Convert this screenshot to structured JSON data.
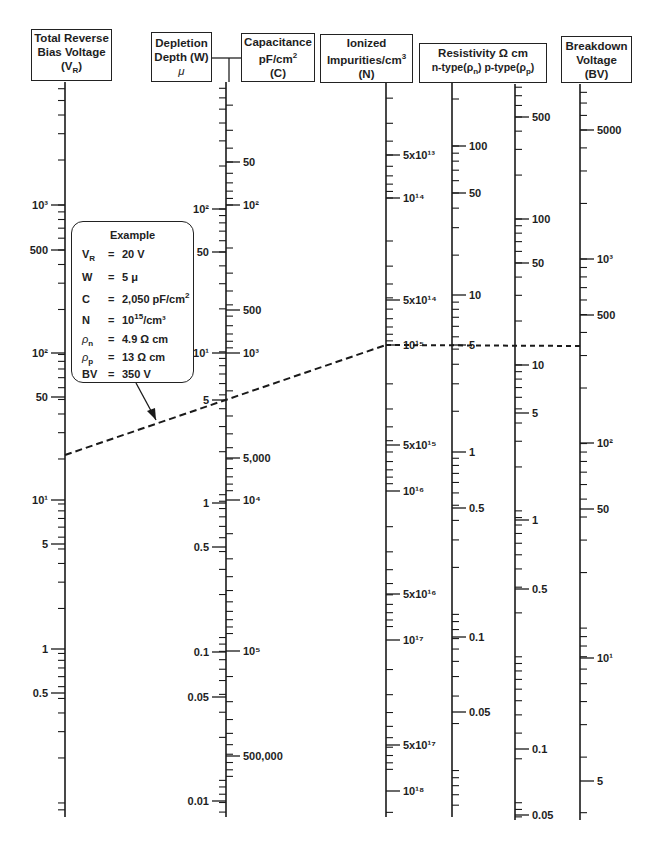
{
  "headers": {
    "vr": {
      "line1": "Total Reverse",
      "line2": "Bias Voltage",
      "line3": "(V",
      "line3_sub": "R",
      "line3_end": ")"
    },
    "w": {
      "line1": "Depletion",
      "line2": "Depth (W)",
      "line3": "μ"
    },
    "c": {
      "line1": "Capacitance",
      "line2": "pF/cm",
      "line2_sup": "2",
      "line3": "(C)"
    },
    "n": {
      "line1": "Ionized",
      "line2": "Impurities/cm",
      "line2_sup": "3",
      "line3": "(N)"
    },
    "rho": {
      "line1": "Resistivity Ω cm",
      "line2a": "n-type(ρ",
      "line2a_sub": "n",
      "line2b": ") p-type(ρ",
      "line2b_sub": "p",
      "line2c": ")"
    },
    "bv": {
      "line1": "Breakdown",
      "line2": "Voltage",
      "line3": "(BV)"
    }
  },
  "example": {
    "title": "Example",
    "rows": [
      {
        "sym": "V",
        "sym_sub": "R",
        "eq": "=",
        "val": "20 V",
        "sup": "",
        "tail": ""
      },
      {
        "sym": "W",
        "sym_sub": "",
        "eq": "=",
        "val": "5 μ",
        "sup": "",
        "tail": ""
      },
      {
        "sym": "C",
        "sym_sub": "",
        "eq": "=",
        "val": "2,050 pF/cm",
        "sup": "2",
        "tail": ""
      },
      {
        "sym": "N",
        "sym_sub": "",
        "eq": "=",
        "val": "10",
        "sup": "15",
        "tail": "/cm³"
      },
      {
        "sym": "ρ",
        "sym_sub": "n",
        "eq": "=",
        "val": "4.9 Ω cm",
        "sup": "",
        "tail": ""
      },
      {
        "sym": "ρ",
        "sym_sub": "p",
        "eq": "=",
        "val": "13 Ω cm",
        "sup": "",
        "tail": ""
      },
      {
        "sym": "BV",
        "sym_sub": "",
        "eq": "=",
        "val": "350 V",
        "sup": "",
        "tail": ""
      }
    ]
  },
  "chart_data": {
    "type": "nomograph",
    "axes": [
      {
        "id": "vr",
        "name": "Total Reverse Bias Voltage (V_R)",
        "x": 65,
        "y_top": 82,
        "y_bottom": 817,
        "label_side": "left",
        "labels": [
          {
            "text": "10³",
            "value": 1000,
            "y": 205
          },
          {
            "text": "500",
            "value": 500,
            "y": 250
          },
          {
            "text": "10²",
            "value": 100,
            "y": 353
          },
          {
            "text": "50",
            "value": 50,
            "y": 397
          },
          {
            "text": "10¹",
            "value": 10,
            "y": 500
          },
          {
            "text": "5",
            "value": 5,
            "y": 544
          },
          {
            "text": "1",
            "value": 1,
            "y": 649
          },
          {
            "text": "0.5",
            "value": 0.5,
            "y": 693
          }
        ]
      },
      {
        "id": "w",
        "name": "Depletion Depth (W) μ",
        "x": 226,
        "y_top": 82,
        "y_bottom": 817,
        "label_side": "left",
        "labels": [
          {
            "text": "10²",
            "value": 100,
            "y": 209
          },
          {
            "text": "50",
            "value": 50,
            "y": 252
          },
          {
            "text": "10¹",
            "value": 10,
            "y": 353
          },
          {
            "text": "5",
            "value": 5,
            "y": 400
          },
          {
            "text": "1",
            "value": 1,
            "y": 503
          },
          {
            "text": "0.5",
            "value": 0.5,
            "y": 547
          },
          {
            "text": "0.1",
            "value": 0.1,
            "y": 652
          },
          {
            "text": "0.05",
            "value": 0.05,
            "y": 697
          },
          {
            "text": "0.01",
            "value": 0.01,
            "y": 801
          }
        ]
      },
      {
        "id": "c",
        "name": "Capacitance pF/cm² (C)",
        "x": 226,
        "label_side": "right",
        "labels": [
          {
            "text": "50",
            "value": 50,
            "y": 162
          },
          {
            "text": "10²",
            "value": 100,
            "y": 205
          },
          {
            "text": "500",
            "value": 500,
            "y": 310
          },
          {
            "text": "10³",
            "value": 1000,
            "y": 353
          },
          {
            "text": "5,000",
            "value": 5000,
            "y": 458
          },
          {
            "text": "10⁴",
            "value": 10000,
            "y": 500
          },
          {
            "text": "10⁵",
            "value": 100000,
            "y": 651
          },
          {
            "text": "500,000",
            "value": 500000,
            "y": 756
          }
        ]
      },
      {
        "id": "n",
        "name": "Ionized Impurities/cm³ (N)",
        "x": 386,
        "y_top": 82,
        "y_bottom": 817,
        "label_side": "right",
        "labels": [
          {
            "text": "5x10¹³",
            "value": 50000000000000.0,
            "y": 155
          },
          {
            "text": "10¹⁴",
            "value": 100000000000000.0,
            "y": 198
          },
          {
            "text": "5x10¹⁴",
            "value": 500000000000000.0,
            "y": 300
          },
          {
            "text": "10¹⁵",
            "value": 1000000000000000.0,
            "y": 345
          },
          {
            "text": "5x10¹⁵",
            "value": 5000000000000000.0,
            "y": 445
          },
          {
            "text": "10¹⁶",
            "value": 1e+16,
            "y": 491
          },
          {
            "text": "5x10¹⁶",
            "value": 5e+16,
            "y": 594
          },
          {
            "text": "10¹⁷",
            "value": 1e+17,
            "y": 640
          },
          {
            "text": "5x10¹⁷",
            "value": 5e+17,
            "y": 745
          },
          {
            "text": "10¹⁸",
            "value": 1e+18,
            "y": 791
          }
        ]
      },
      {
        "id": "rho_n",
        "name": "Resistivity n-type (ρn) Ω cm",
        "x": 452,
        "y_top": 82,
        "y_bottom": 817,
        "label_side": "right",
        "labels": [
          {
            "text": "100",
            "value": 100,
            "y": 146
          },
          {
            "text": "50",
            "value": 50,
            "y": 193
          },
          {
            "text": "10",
            "value": 10,
            "y": 295
          },
          {
            "text": "5",
            "value": 5,
            "y": 345
          },
          {
            "text": "1",
            "value": 1,
            "y": 452
          },
          {
            "text": "0.5",
            "value": 0.5,
            "y": 508
          },
          {
            "text": "0.1",
            "value": 0.1,
            "y": 637
          },
          {
            "text": "0.05",
            "value": 0.05,
            "y": 712
          }
        ]
      },
      {
        "id": "rho_p",
        "name": "Resistivity p-type (ρp) Ω cm",
        "x": 515,
        "y_top": 84,
        "y_bottom": 820,
        "label_side": "right",
        "labels": [
          {
            "text": "500",
            "value": 500,
            "y": 117
          },
          {
            "text": "100",
            "value": 100,
            "y": 219
          },
          {
            "text": "50",
            "value": 50,
            "y": 263
          },
          {
            "text": "10",
            "value": 10,
            "y": 365
          },
          {
            "text": "5",
            "value": 5,
            "y": 413
          },
          {
            "text": "1",
            "value": 1,
            "y": 520
          },
          {
            "text": "0.5",
            "value": 0.5,
            "y": 589
          },
          {
            "text": "0.1",
            "value": 0.1,
            "y": 749
          },
          {
            "text": "0.05",
            "value": 0.05,
            "y": 815
          }
        ]
      },
      {
        "id": "bv",
        "name": "Breakdown Voltage (BV)",
        "x": 580,
        "y_top": 84,
        "y_bottom": 820,
        "label_side": "right",
        "labels": [
          {
            "text": "5000",
            "value": 5000,
            "y": 130
          },
          {
            "text": "10³",
            "value": 1000,
            "y": 259
          },
          {
            "text": "500",
            "value": 500,
            "y": 315
          },
          {
            "text": "10²",
            "value": 100,
            "y": 443
          },
          {
            "text": "50",
            "value": 50,
            "y": 509
          },
          {
            "text": "10¹",
            "value": 10,
            "y": 658
          },
          {
            "text": "5",
            "value": 5,
            "y": 781
          }
        ]
      }
    ],
    "example_line": {
      "segment1": {
        "from": {
          "axis": "vr",
          "value": 20,
          "x": 65,
          "y": 455
        },
        "through": {
          "axis": "w",
          "value": 5,
          "x": 226,
          "y": 400
        },
        "to": {
          "axis": "n",
          "value": 1000000000000000.0,
          "x": 386,
          "y": 345
        }
      },
      "segment2": {
        "from": {
          "axis": "n",
          "value": 1000000000000000.0,
          "x": 386,
          "y": 345
        },
        "to": {
          "axis": "bv",
          "value": 350,
          "x": 580,
          "y": 346
        }
      },
      "arrow": {
        "x1": 136,
        "y1": 383,
        "x2": 156,
        "y2": 420
      }
    }
  }
}
